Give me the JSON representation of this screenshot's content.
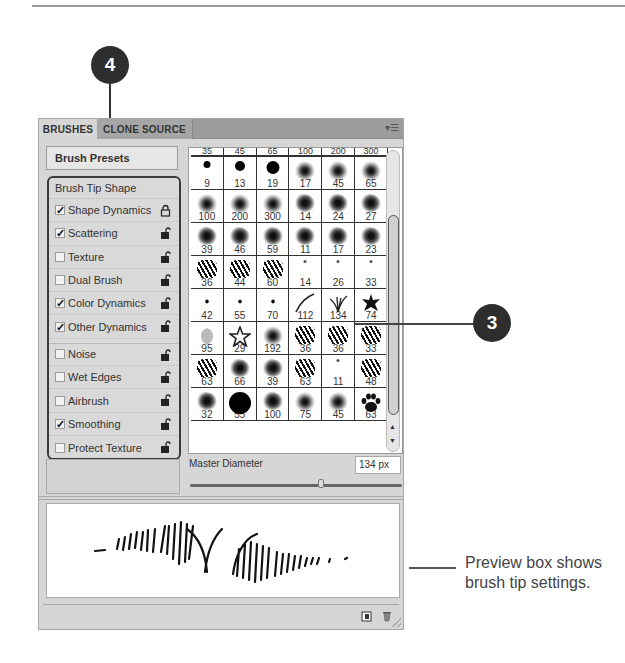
{
  "panel": {
    "tabs": [
      {
        "label": "BRUSHES",
        "active": true
      },
      {
        "label": "CLONE SOURCE",
        "active": false
      }
    ],
    "menu_icon": "panel-menu-icon",
    "presets_button": "Brush Presets",
    "options_heading": "Brush Tip Shape",
    "options": [
      {
        "label": "Shape Dynamics",
        "checked": true,
        "lock": "locked"
      },
      {
        "label": "Scattering",
        "checked": true,
        "lock": "unlocked"
      },
      {
        "label": "Texture",
        "checked": false,
        "lock": "unlocked"
      },
      {
        "label": "Dual Brush",
        "checked": false,
        "lock": "unlocked"
      },
      {
        "label": "Color Dynamics",
        "checked": true,
        "lock": "unlocked"
      },
      {
        "label": "Other Dynamics",
        "checked": true,
        "lock": "unlocked"
      },
      {
        "label": "Noise",
        "checked": false,
        "lock": "unlocked"
      },
      {
        "label": "Wet Edges",
        "checked": false,
        "lock": "unlocked"
      },
      {
        "label": "Airbrush",
        "checked": false,
        "lock": "unlocked"
      },
      {
        "label": "Smoothing",
        "checked": true,
        "lock": "unlocked"
      },
      {
        "label": "Protect Texture",
        "checked": false,
        "lock": "unlocked"
      }
    ],
    "brush_grid": {
      "header_partial": [
        "35",
        "45",
        "65",
        "100",
        "200",
        "300"
      ],
      "rows": [
        [
          {
            "size": "9",
            "shape": "dot"
          },
          {
            "size": "13",
            "shape": "dot"
          },
          {
            "size": "19",
            "shape": "dot"
          },
          {
            "size": "17",
            "shape": "soft"
          },
          {
            "size": "45",
            "shape": "soft"
          },
          {
            "size": "65",
            "shape": "soft"
          }
        ],
        [
          {
            "size": "100",
            "shape": "soft"
          },
          {
            "size": "200",
            "shape": "soft"
          },
          {
            "size": "300",
            "shape": "soft"
          },
          {
            "size": "14",
            "shape": "splat"
          },
          {
            "size": "24",
            "shape": "splat"
          },
          {
            "size": "27",
            "shape": "splat"
          }
        ],
        [
          {
            "size": "39",
            "shape": "splat"
          },
          {
            "size": "46",
            "shape": "splat"
          },
          {
            "size": "59",
            "shape": "splat"
          },
          {
            "size": "11",
            "shape": "splat"
          },
          {
            "size": "17",
            "shape": "splat"
          },
          {
            "size": "23",
            "shape": "splat"
          }
        ],
        [
          {
            "size": "36",
            "shape": "grass"
          },
          {
            "size": "44",
            "shape": "grass"
          },
          {
            "size": "60",
            "shape": "grass"
          },
          {
            "size": "14",
            "shape": "tiny"
          },
          {
            "size": "26",
            "shape": "tiny"
          },
          {
            "size": "33",
            "shape": "tiny"
          }
        ],
        [
          {
            "size": "42",
            "shape": "sparkle"
          },
          {
            "size": "55",
            "shape": "sparkle"
          },
          {
            "size": "70",
            "shape": "sparkle"
          },
          {
            "size": "112",
            "shape": "stroke"
          },
          {
            "size": "134",
            "shape": "grass-blade",
            "selected": true
          },
          {
            "size": "74",
            "shape": "leaf"
          }
        ],
        [
          {
            "size": "95",
            "shape": "leaf-light"
          },
          {
            "size": "29",
            "shape": "star-outline"
          },
          {
            "size": "192",
            "shape": "soft"
          },
          {
            "size": "36",
            "shape": "grass"
          },
          {
            "size": "36",
            "shape": "grass"
          },
          {
            "size": "33",
            "shape": "grass"
          }
        ],
        [
          {
            "size": "63",
            "shape": "grass"
          },
          {
            "size": "66",
            "shape": "splat"
          },
          {
            "size": "39",
            "shape": "splat"
          },
          {
            "size": "63",
            "shape": "grass"
          },
          {
            "size": "11",
            "shape": "tiny"
          },
          {
            "size": "48",
            "shape": "grass"
          }
        ],
        [
          {
            "size": "32",
            "shape": "splat"
          },
          {
            "size": "55",
            "shape": "dot"
          },
          {
            "size": "100",
            "shape": "splat"
          },
          {
            "size": "75",
            "shape": "soft"
          },
          {
            "size": "45",
            "shape": "soft"
          },
          {
            "size": "63",
            "shape": "paw"
          }
        ]
      ]
    },
    "master_diameter": {
      "label": "Master Diameter",
      "value": "134 px",
      "slider_percent": 62
    },
    "footer_icons": [
      "new-preset-icon",
      "delete-icon",
      "resize-grip-icon"
    ]
  },
  "callouts": [
    {
      "number": "4",
      "target": "brush-options-list"
    },
    {
      "number": "3",
      "target": "brush-grid"
    }
  ],
  "caption": "Preview box shows brush tip settings."
}
